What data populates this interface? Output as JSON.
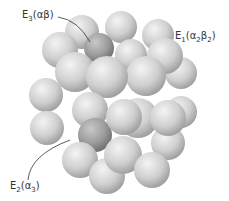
{
  "diagram": {
    "type": "space-filling protein quaternary structure (sphere cluster)",
    "labels": [
      {
        "id": "E3",
        "letter": "E",
        "sub": "3",
        "subunits": "(αβ)",
        "x": 22,
        "y": 9
      },
      {
        "id": "E1",
        "letter": "E",
        "sub": "1",
        "subunits_parts": [
          "(α",
          "2",
          "β",
          "2",
          ")"
        ],
        "x": 175,
        "y": 30
      },
      {
        "id": "E2",
        "letter": "E",
        "sub": "2",
        "subunits_parts": [
          "(α",
          "3",
          ")"
        ],
        "x": 10,
        "y": 180
      }
    ],
    "colors": {
      "sphere_light": "#e6e6e6",
      "sphere_mid": "#c4c4c4",
      "sphere_dark": "#9a9a9a",
      "highlight_dark": "#8c8c8c",
      "text": "#333333",
      "leader": "#333333"
    }
  }
}
